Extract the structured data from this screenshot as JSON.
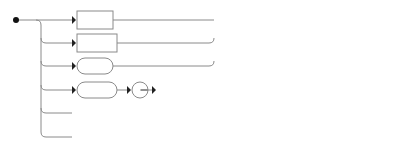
{
  "diagram": {
    "type": "railroad",
    "choices": [
      {
        "label": "Literal",
        "kind": "nonterminal"
      },
      {
        "label": "Name",
        "kind": "nonterminal"
      },
      {
        "label": "this",
        "kind": "terminal"
      },
      {
        "sequence": [
          {
            "label": "super",
            "kind": "terminal"
          },
          {
            "label": ".",
            "kind": "terminal"
          },
          {
            "label": "Identifier",
            "kind": "nonterminal"
          }
        ]
      },
      {
        "sequence": [
          {
            "label": "(",
            "kind": "terminal"
          },
          {
            "label": "Expression",
            "kind": "nonterminal"
          },
          {
            "label": ")",
            "kind": "terminal"
          }
        ]
      },
      {
        "label": "Allocation",
        "kind": "nonterminal"
      }
    ],
    "repeat": {
      "label": "Primary Suffix",
      "kind": "nonterminal",
      "optional": true
    }
  },
  "colors": {
    "line": "#8a8a8a",
    "text": "#222222",
    "marker": "#111111"
  }
}
